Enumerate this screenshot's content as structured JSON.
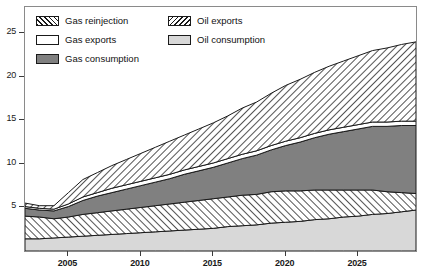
{
  "chart_data": {
    "type": "area",
    "stacked": true,
    "title": "",
    "subtitle": "",
    "xlabel": "",
    "ylabel": "",
    "xlim": [
      2002,
      2029
    ],
    "ylim": [
      0,
      28
    ],
    "yticks": [
      5,
      10,
      15,
      20,
      25
    ],
    "xticks": [
      2005,
      2010,
      2015,
      2020,
      2025
    ],
    "grid": false,
    "legend_position": "top-left",
    "x": [
      2002,
      2003,
      2004,
      2005,
      2006,
      2007,
      2008,
      2009,
      2010,
      2011,
      2012,
      2013,
      2014,
      2015,
      2016,
      2017,
      2018,
      2019,
      2020,
      2021,
      2022,
      2023,
      2024,
      2025,
      2026,
      2027,
      2028,
      2029
    ],
    "series": [
      {
        "name": "Oil consumption",
        "fill": "#d8d8d8",
        "pattern": "solid",
        "values": [
          1.4,
          1.4,
          1.5,
          1.6,
          1.7,
          1.8,
          1.9,
          2.0,
          2.1,
          2.2,
          2.3,
          2.4,
          2.5,
          2.6,
          2.8,
          2.9,
          3.0,
          3.2,
          3.3,
          3.4,
          3.6,
          3.7,
          3.9,
          4.0,
          4.2,
          4.3,
          4.5,
          4.7
        ]
      },
      {
        "name": "Oil exports",
        "fill": "#ffffff",
        "pattern": "forward-hatch",
        "values": [
          2.6,
          2.5,
          2.2,
          2.3,
          2.5,
          2.6,
          2.7,
          2.8,
          2.9,
          3.0,
          3.1,
          3.2,
          3.3,
          3.4,
          3.4,
          3.5,
          3.5,
          3.6,
          3.6,
          3.5,
          3.4,
          3.3,
          3.1,
          3.0,
          2.8,
          2.5,
          2.2,
          1.9
        ]
      },
      {
        "name": "Gas consumption",
        "fill": "#808080",
        "pattern": "solid",
        "values": [
          0.9,
          0.8,
          0.9,
          1.2,
          1.6,
          1.9,
          2.1,
          2.3,
          2.5,
          2.7,
          2.9,
          3.2,
          3.4,
          3.6,
          3.9,
          4.2,
          4.5,
          4.8,
          5.2,
          5.6,
          6.0,
          6.4,
          6.7,
          7.0,
          7.3,
          7.5,
          7.7,
          7.8
        ]
      },
      {
        "name": "Gas exports",
        "fill": "#ffffff",
        "pattern": "solid",
        "values": [
          0.2,
          0.2,
          0.2,
          0.3,
          0.4,
          0.4,
          0.5,
          0.5,
          0.5,
          0.5,
          0.5,
          0.5,
          0.5,
          0.5,
          0.5,
          0.5,
          0.5,
          0.5,
          0.5,
          0.5,
          0.5,
          0.5,
          0.5,
          0.5,
          0.5,
          0.5,
          0.5,
          0.5
        ]
      },
      {
        "name": "Gas reinjection",
        "fill": "#ffffff",
        "pattern": "back-hatch",
        "values": [
          0.4,
          0.3,
          0.4,
          1.3,
          2.0,
          2.3,
          2.6,
          2.9,
          3.2,
          3.5,
          3.8,
          4.0,
          4.3,
          4.6,
          4.9,
          5.3,
          5.6,
          6.0,
          6.4,
          6.7,
          7.0,
          7.3,
          7.6,
          7.9,
          8.2,
          8.5,
          8.8,
          9.1
        ]
      }
    ],
    "totals": [
      5.5,
      5.2,
      5.2,
      6.7,
      8.2,
      9.0,
      9.8,
      10.5,
      11.2,
      11.9,
      12.6,
      13.3,
      14.0,
      14.7,
      15.5,
      16.4,
      17.1,
      18.1,
      19.0,
      19.7,
      20.5,
      21.2,
      21.8,
      22.4,
      23.0,
      23.3,
      23.7,
      24.0
    ]
  },
  "legend": {
    "items": [
      {
        "label": "Gas reinjection",
        "swatch": "sw-gas-reinjection"
      },
      {
        "label": "Gas exports",
        "swatch": "sw-gas-exports"
      },
      {
        "label": "Gas consumption",
        "swatch": "sw-gas-consumption"
      },
      {
        "label": "Oil exports",
        "swatch": "sw-oil-exports"
      },
      {
        "label": "Oil consumption",
        "swatch": "sw-oil-consumption"
      }
    ]
  },
  "axes": {
    "y_labels": [
      "25",
      "20",
      "15",
      "10",
      "5"
    ],
    "x_labels": [
      "2005",
      "2010",
      "2015",
      "2020",
      "2025"
    ]
  }
}
